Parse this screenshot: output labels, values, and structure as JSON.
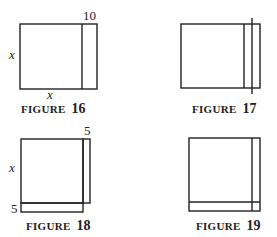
{
  "figures": [
    {
      "id": "figure-16",
      "caption_word": "FIGURE",
      "caption_number": "16",
      "labels": {
        "top_strip": "10",
        "left_side": "x",
        "bottom_side": "x"
      }
    },
    {
      "id": "figure-17",
      "caption_word": "FIGURE",
      "caption_number": "17",
      "labels": {}
    },
    {
      "id": "figure-18",
      "caption_word": "FIGURE",
      "caption_number": "18",
      "labels": {
        "top_strip": "5",
        "left_side": "x",
        "bottom_strip": "5"
      }
    },
    {
      "id": "figure-19",
      "caption_word": "FIGURE",
      "caption_number": "19",
      "labels": {}
    }
  ]
}
